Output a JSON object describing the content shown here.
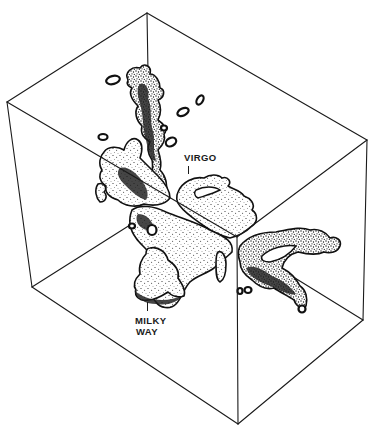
{
  "figure": {
    "labels": {
      "virgo": "VIRGO",
      "milky_way_line1": "MILKY",
      "milky_way_line2": "WAY"
    },
    "colors": {
      "ink": "#1a1a1a",
      "background": "#ffffff"
    },
    "box_vertices": {
      "top_back": [
        147,
        13
      ],
      "left": [
        7,
        102
      ],
      "right": [
        367,
        140
      ],
      "front_center": [
        237,
        237
      ],
      "bottom_left": [
        32,
        287
      ],
      "bottom_right": [
        363,
        320
      ],
      "bottom_front": [
        238,
        424
      ]
    }
  }
}
